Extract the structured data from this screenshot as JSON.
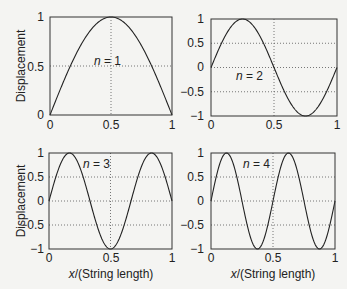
{
  "chart_data": [
    {
      "type": "line",
      "title": "",
      "annotation": "n = 1",
      "xlabel": "",
      "ylabel": "Displacement",
      "xlim": [
        0,
        1
      ],
      "ylim": [
        0,
        1
      ],
      "xticks": [
        "0",
        "0.5",
        "1"
      ],
      "yticks": [
        "0",
        "0.5",
        "1"
      ],
      "grid": "dotted at x=0.5, y=0.5",
      "x": [
        0,
        0.1,
        0.2,
        0.3,
        0.4,
        0.5,
        0.6,
        0.7,
        0.8,
        0.9,
        1.0
      ],
      "series": [
        {
          "name": "sin(1πx)",
          "values": [
            0,
            0.309,
            0.588,
            0.809,
            0.951,
            1.0,
            0.951,
            0.809,
            0.588,
            0.309,
            0
          ]
        }
      ]
    },
    {
      "type": "line",
      "title": "",
      "annotation": "n = 2",
      "xlabel": "",
      "ylabel": "",
      "xlim": [
        0,
        1
      ],
      "ylim": [
        -1,
        1
      ],
      "xticks": [
        "0",
        "0.5",
        "1"
      ],
      "yticks": [
        "−1",
        "−0.5",
        "0",
        "0.5",
        "1"
      ],
      "grid": "dotted",
      "x": [
        0,
        0.125,
        0.25,
        0.375,
        0.5,
        0.625,
        0.75,
        0.875,
        1.0
      ],
      "series": [
        {
          "name": "sin(2πx)",
          "values": [
            0,
            0.707,
            1.0,
            0.707,
            0,
            -0.707,
            -1.0,
            -0.707,
            0
          ]
        }
      ]
    },
    {
      "type": "line",
      "title": "",
      "annotation": "n = 3",
      "xlabel": "x/(String length)",
      "ylabel": "Displacement",
      "xlim": [
        0,
        1
      ],
      "ylim": [
        -1,
        1
      ],
      "xticks": [
        "0",
        "0.5",
        "1"
      ],
      "yticks": [
        "−1",
        "−0.5",
        "0",
        "0.5",
        "1"
      ],
      "grid": "dotted",
      "x": [
        0,
        0.1667,
        0.3333,
        0.5,
        0.6667,
        0.8333,
        1.0
      ],
      "series": [
        {
          "name": "sin(3πx)",
          "values": [
            0,
            1.0,
            0,
            -1.0,
            0,
            1.0,
            0
          ]
        }
      ]
    },
    {
      "type": "line",
      "title": "",
      "annotation": "n = 4",
      "xlabel": "x/(String length)",
      "ylabel": "",
      "xlim": [
        0,
        1
      ],
      "ylim": [
        -1,
        1
      ],
      "xticks": [
        "0",
        "0.5",
        "1"
      ],
      "yticks": [
        "−1",
        "−0.5",
        "0",
        "0.5",
        "1"
      ],
      "grid": "dotted",
      "x": [
        0,
        0.125,
        0.25,
        0.375,
        0.5,
        0.625,
        0.75,
        0.875,
        1.0
      ],
      "series": [
        {
          "name": "sin(4πx)",
          "values": [
            0,
            1.0,
            0,
            -1.0,
            0,
            1.0,
            0,
            -1.0,
            0
          ]
        }
      ]
    }
  ],
  "labels": {
    "ylabel": "Displacement",
    "xlabel_italic": "x",
    "xlabel_rest": "/(String length)",
    "n_italic": "n",
    "ann1": " = 1",
    "ann2": " = 2",
    "ann3": " = 3",
    "ann4": " = 4",
    "t0": "0",
    "t05": "0.5",
    "t1": "1",
    "tm05": "−0.5",
    "tm1": "−1"
  }
}
